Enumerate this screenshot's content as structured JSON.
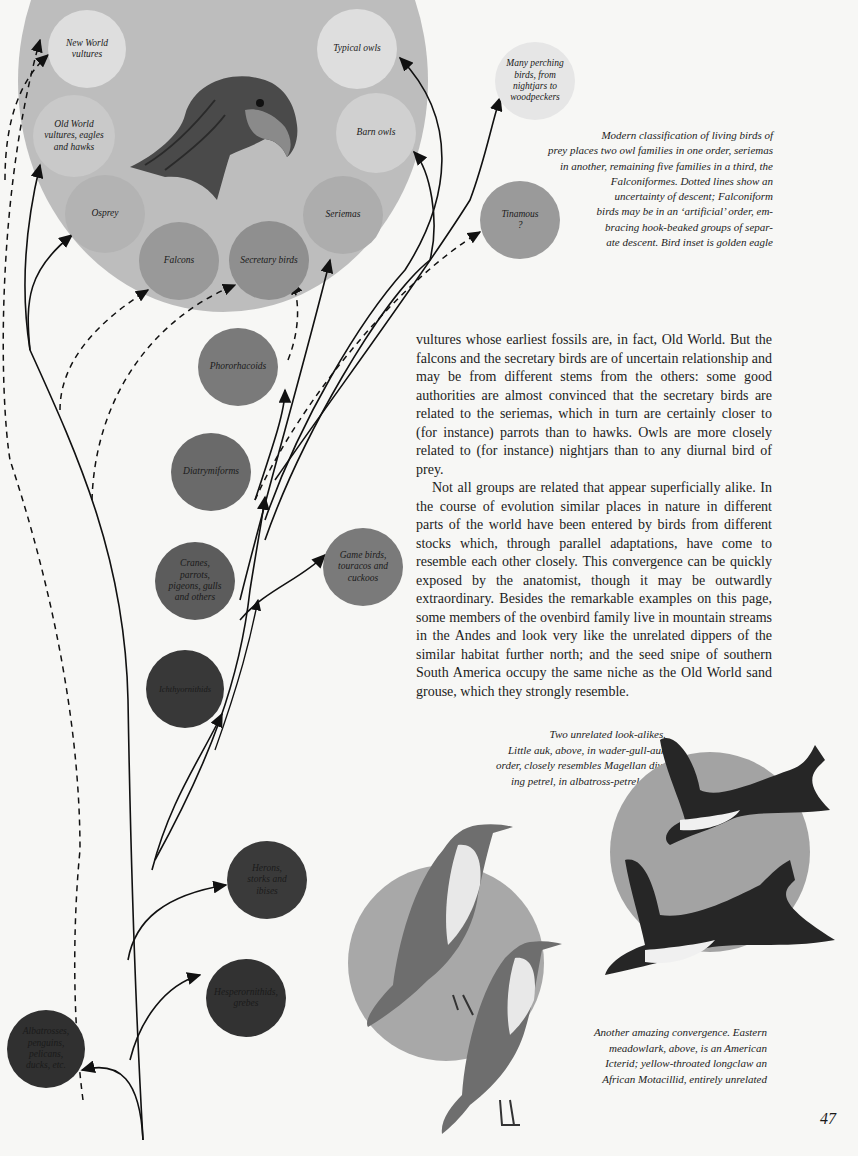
{
  "page": {
    "page_number": "47"
  },
  "diagram": {
    "big_circle_color": "#bdbdbd",
    "nodes": [
      {
        "id": "new-world-vultures",
        "label": "New World\nvultures",
        "color": "#dedede"
      },
      {
        "id": "old-world-vultures",
        "label": "Old World\nvultures, eagles\nand hawks",
        "color": "#c9c9c9"
      },
      {
        "id": "osprey",
        "label": "Osprey",
        "color": "#b3b3b3"
      },
      {
        "id": "falcons",
        "label": "Falcons",
        "color": "#999999"
      },
      {
        "id": "secretary-birds",
        "label": "Secretary birds",
        "color": "#8f8f8f"
      },
      {
        "id": "seriemas",
        "label": "Seriemas",
        "color": "#adadad"
      },
      {
        "id": "barn-owls",
        "label": "Barn owls",
        "color": "#d0d0d0"
      },
      {
        "id": "typical-owls",
        "label": "Typical owls",
        "color": "#dedede"
      },
      {
        "id": "many-perching-birds",
        "label": "Many perching\nbirds, from\nnightjars to\nwoodpeckers",
        "color": "#e6e6e6"
      },
      {
        "id": "tinamous",
        "label": "Tinamous\n?",
        "color": "#9a9a9a"
      },
      {
        "id": "phororhacoids",
        "label": "Phororhacoids",
        "color": "#7a7a7a"
      },
      {
        "id": "diatrymiforms",
        "label": "Diatrymiforms",
        "color": "#6a6a6a"
      },
      {
        "id": "cranes",
        "label": "Cranes,\nparrots,\npigeons, gulls\nand others",
        "color": "#5c5c5c"
      },
      {
        "id": "game-birds",
        "label": "Game birds,\ntouracos and\ncuckoos",
        "color": "#7a7a7a"
      },
      {
        "id": "ichthyornithids",
        "label": "Ichthyornithids",
        "color": "#383838"
      },
      {
        "id": "herons",
        "label": "Herons,\nstorks and\nibises",
        "color": "#3a3a3a"
      },
      {
        "id": "hesperornithids",
        "label": "Hesperornithids,\ngrebes",
        "color": "#323232"
      },
      {
        "id": "albatrosses",
        "label": "Albatrosses,\npenguins,\npelicans,\nducks, etc.",
        "color": "#303030"
      }
    ],
    "inset_label": "golden eagle",
    "legend": {
      "solid": "descent",
      "dashed": "uncertainty of descent"
    }
  },
  "captions": {
    "classification": "Modern classification of living birds of\nprey places two owl families in one order, seriemas\nin another, remaining five families in a third, the\nFalconiformes.  Dotted lines show an\nuncertainty of descent; Falconiform\nbirds may be in an ‘artificial’ order, em-\nbracing hook-beaked groups of separ-\nate descent.  Bird inset is golden eagle",
    "look_alikes": "Two unrelated look-alikes.\nLittle auk, above, in wader-gull-auk\norder, closely resembles Magellan div-\ning petrel, in albatross-petrel order",
    "convergence": "Another amazing convergence.  Eastern\nmeadowlark, above, is an American\nIcterid; yellow-throated longclaw an\nAfrican Motacillid, entirely unrelated"
  },
  "body": {
    "paragraph1": "vultures whose earliest fossils are, in fact, Old World. But the falcons and the secretary birds are of uncertain relationship and may be from different stems from the others: some good authorities are almost convinced that the secretary birds are related to the seriemas, which in turn are certainly closer to (for instance) parrots than to hawks. Owls are more closely related to (for instance) nightjars than to any diurnal bird of prey.",
    "paragraph2": "Not all groups are related that appear superficially alike. In the course of evolution similar places in nature in different parts of the world have been entered by birds from different stocks which, through parallel adaptations, have come to resemble each other closely. This convergence can be quickly exposed by the anatomist, though it may be outwardly extraordinary. Besides the remarkable examples on this page, some members of the ovenbird family live in mountain streams in the Andes and look very like the unrelated dippers of the similar habitat further north; and the seed snipe of southern South America occupy the same niche as the Old World sand grouse, which they strongly resemble."
  },
  "illustrations": {
    "eagle": "golden eagle",
    "auk": "little auk",
    "petrel": "Magellan diving petrel",
    "meadowlark": "eastern meadowlark",
    "longclaw": "yellow-throated longclaw"
  }
}
